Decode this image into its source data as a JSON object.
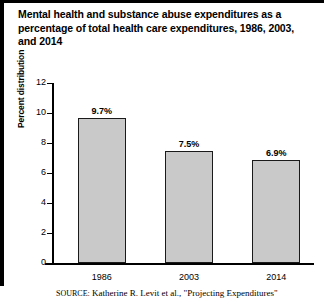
{
  "figure": {
    "title_lines": [
      "Mental health and substance abuse expenditures as a",
      "percentage of total health care expenditures, 1986, 2003,",
      "and 2014"
    ],
    "source_label": "SOURCE:",
    "source_text": "Katherine R. Levit et al., \"Projecting Expenditures\""
  },
  "chart_data": {
    "type": "bar",
    "title": "Mental health and substance abuse expenditures as a percentage of total health care expenditures, 1986, 2003, and 2014",
    "categories": [
      "1986",
      "2003",
      "2014"
    ],
    "values": [
      9.7,
      7.5,
      6.9
    ],
    "value_labels": [
      "9.7%",
      "7.5%",
      "6.9%"
    ],
    "xlabel": "",
    "ylabel": "Percent distribution",
    "ylim": [
      0,
      12
    ],
    "yticks": [
      0,
      2,
      4,
      6,
      8,
      10,
      12
    ],
    "ytick_labels": [
      "0",
      "2",
      "4",
      "6",
      "8",
      "10",
      "12"
    ],
    "grid": false,
    "legend": false,
    "bar_fill_color": "#c9c9c9",
    "bar_edge_color": "#1a1a1a"
  }
}
